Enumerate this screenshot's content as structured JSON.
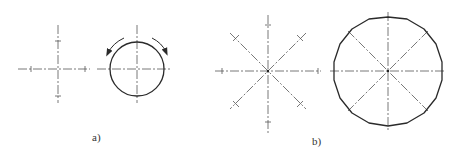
{
  "colors": {
    "background": "#ffffff",
    "stroke": "#3a3a3a",
    "centerline": "#555555"
  },
  "labels": {
    "a": "a)",
    "b": "b)"
  },
  "figure_a": {
    "cross": {
      "cx": 58,
      "cy": 69,
      "h_extent": [
        18,
        90
      ],
      "v_extent": [
        25,
        103
      ],
      "ticks_x": [
        31,
        85
      ],
      "ticks_y": [
        41,
        96
      ]
    },
    "circle": {
      "cx": 137,
      "cy": 69,
      "r": 27,
      "h_extent": [
        97,
        172
      ],
      "v_extent": [
        25,
        103
      ],
      "arrows": [
        "rotate-left-arrow",
        "rotate-right-arrow"
      ]
    }
  },
  "figure_b": {
    "star": {
      "cx": 268,
      "cy": 71,
      "arm_length": 52,
      "tick_radius": 46,
      "angles_deg": [
        0,
        45,
        90,
        135,
        180,
        225,
        270,
        315
      ]
    },
    "circle": {
      "cx": 388,
      "cy": 71,
      "r": 54,
      "centerline_angles_deg": [
        0,
        45,
        90,
        135
      ]
    }
  }
}
